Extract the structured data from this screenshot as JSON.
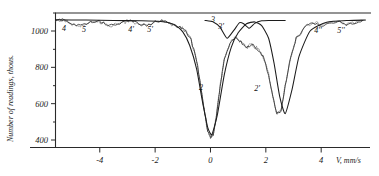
{
  "figure": {
    "kind": "moessbauer-absorption-spectrum",
    "background": "#ffffff",
    "ink_color": "#1c1c1c"
  },
  "axes": {
    "y_title": "Number of readings, thous.",
    "x_title": "V, mm/s",
    "y_ticks": [
      "400",
      "600",
      "800",
      "1000"
    ],
    "x_ticks": [
      "-4",
      "-2",
      "0",
      "2",
      "4"
    ]
  },
  "peak_labels": [
    {
      "text": "4",
      "x": 64,
      "y": 31
    },
    {
      "text": "5",
      "x": 84,
      "y": 32
    },
    {
      "text": "4'",
      "x": 131,
      "y": 32
    },
    {
      "text": "5'",
      "x": 150,
      "y": 32
    },
    {
      "text": "3",
      "x": 213,
      "y": 22
    },
    {
      "text": "3'",
      "x": 221,
      "y": 29
    },
    {
      "text": "2",
      "x": 201,
      "y": 90
    },
    {
      "text": "2'",
      "x": 257,
      "y": 91
    },
    {
      "text": "4''",
      "x": 318,
      "y": 33
    },
    {
      "text": "5''",
      "x": 341,
      "y": 33
    }
  ],
  "chart_data": {
    "type": "line",
    "title": "",
    "xlabel": "V, mm/s",
    "ylabel": "Number of readings, thous.",
    "xlim": [
      -5.6,
      5.8
    ],
    "ylim": [
      380,
      1090
    ],
    "grid": false,
    "legend": null,
    "y_tick_values": [
      400,
      600,
      800,
      1000
    ],
    "x_tick_values": [
      -4,
      -2,
      0,
      2,
      4
    ],
    "annotations": [
      "4",
      "5",
      "4'",
      "5'",
      "3",
      "3'",
      "2",
      "2'",
      "4''",
      "5''"
    ],
    "series": [
      {
        "name": "experimental counts",
        "note": "noisy measured spectrum, baseline ~1060 thous.",
        "x": [
          -5.6,
          -5.3,
          -5.0,
          -4.7,
          -4.4,
          -4.1,
          -3.8,
          -3.5,
          -3.2,
          -2.9,
          -2.6,
          -2.3,
          -2.0,
          -1.7,
          -1.4,
          -1.1,
          -0.9,
          -0.7,
          -0.5,
          -0.35,
          -0.2,
          -0.1,
          0.0,
          0.1,
          0.2,
          0.35,
          0.5,
          0.7,
          0.9,
          1.1,
          1.3,
          1.5,
          1.7,
          1.9,
          2.1,
          2.25,
          2.4,
          2.55,
          2.7,
          2.9,
          3.1,
          3.4,
          3.7,
          4.0,
          4.3,
          4.6,
          4.9,
          5.2,
          5.5
        ],
        "y": [
          1062,
          1058,
          1040,
          1030,
          1044,
          1058,
          1036,
          1028,
          1046,
          1058,
          1040,
          1030,
          1048,
          1056,
          1032,
          1020,
          1000,
          950,
          840,
          690,
          540,
          450,
          415,
          430,
          520,
          700,
          845,
          930,
          965,
          940,
          905,
          930,
          900,
          860,
          760,
          640,
          545,
          560,
          700,
          860,
          960,
          1020,
          1046,
          1032,
          1040,
          1052,
          1036,
          1044,
          1058
        ]
      },
      {
        "name": "fitted envelope 2 / 2'",
        "note": "broad smooth absorption lines 2 and 2'",
        "x": [
          -5.6,
          -4.5,
          -3.5,
          -2.5,
          -1.8,
          -1.3,
          -1.0,
          -0.75,
          -0.5,
          -0.3,
          -0.1,
          0.05,
          0.25,
          0.5,
          0.75,
          1.0,
          1.3,
          1.6,
          1.85,
          2.1,
          2.3,
          2.5,
          2.7,
          2.95,
          3.2,
          3.6,
          4.2,
          5.0,
          5.6
        ],
        "y": [
          1062,
          1060,
          1058,
          1056,
          1052,
          1035,
          995,
          920,
          790,
          620,
          470,
          430,
          540,
          760,
          910,
          990,
          1040,
          1050,
          1030,
          960,
          820,
          640,
          545,
          680,
          860,
          1000,
          1048,
          1058,
          1060
        ]
      },
      {
        "name": "fitted narrow components 3 / 3'",
        "note": "narrow central lines near 0.6 and 1.4 mm/s",
        "x": [
          -0.2,
          0.1,
          0.35,
          0.6,
          0.85,
          1.05,
          1.2,
          1.4,
          1.6,
          1.85,
          2.1,
          2.4,
          2.7
        ],
        "y": [
          1058,
          1050,
          1020,
          960,
          1005,
          1046,
          1040,
          1015,
          1042,
          1056,
          1058,
          1058,
          1058
        ]
      }
    ]
  }
}
